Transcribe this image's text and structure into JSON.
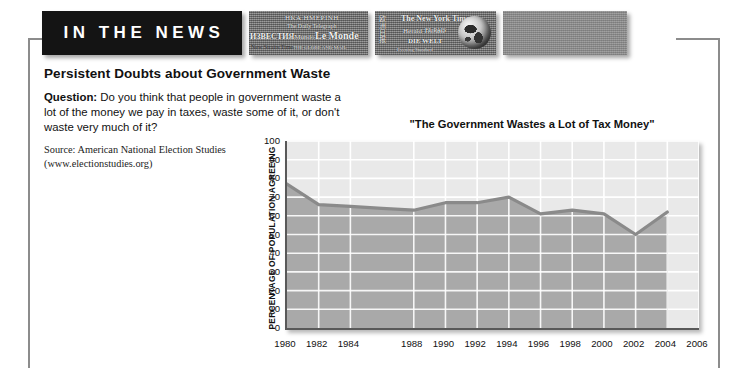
{
  "masthead": {
    "banner_label": "IN THE NEWS",
    "clippings": [
      {
        "id": "strip-a",
        "texts": [
          "ΗΚΑ ΗΜΕΡΙΝΗ",
          "The Daily Telegraph",
          "ИЗВЕСТИЯ",
          "o Mundo",
          "Le Monde",
          "New Straits Times",
          "THE GLOBE AND MAIL"
        ]
      },
      {
        "id": "strip-b",
        "texts": [
          "欧洲日报",
          "The New York Times",
          "Herald Tribune",
          "EL PAIS",
          "DIE WELT",
          "Evening Standard"
        ]
      },
      {
        "id": "strip-c",
        "texts": []
      }
    ]
  },
  "article": {
    "headline": "Persistent Doubts about Government Waste",
    "question_label": "Question:",
    "question_text": " Do you think that people in government waste a lot of the money we pay in taxes, waste some of it, or don't waste very much of it?",
    "source_line1": "Source: American National Election Studies",
    "source_line2": "(www.electionstudies.org)"
  },
  "chart_data": {
    "type": "area",
    "title": "\"The Government Wastes a Lot of Tax Money\"",
    "xlabel": "",
    "ylabel": "PERCENTAGE OF POPULATION AGREEING",
    "ylim": [
      0,
      100
    ],
    "yticks": [
      0,
      10,
      20,
      30,
      40,
      50,
      60,
      70,
      80,
      90,
      100
    ],
    "xlim": [
      1980,
      2006
    ],
    "xticks": [
      1980,
      1982,
      1984,
      1988,
      1990,
      1992,
      1994,
      1996,
      1998,
      2000,
      2002,
      2004,
      2006
    ],
    "grid": true,
    "legend": "none",
    "line_color": "#8a8a8a",
    "fill_color": "#a9a9a9",
    "plot_bg": "#e9e9e9",
    "x": [
      1980,
      1982,
      1984,
      1986,
      1988,
      1990,
      1992,
      1994,
      1996,
      1998,
      2000,
      2002,
      2004
    ],
    "values": [
      77,
      66,
      65,
      64,
      63,
      67,
      67,
      70,
      61,
      63,
      61,
      50,
      62
    ],
    "series": [
      {
        "name": "The Government Wastes a Lot of Tax Money",
        "values": [
          77,
          66,
          65,
          64,
          63,
          67,
          67,
          70,
          61,
          63,
          61,
          50,
          62
        ]
      }
    ]
  }
}
